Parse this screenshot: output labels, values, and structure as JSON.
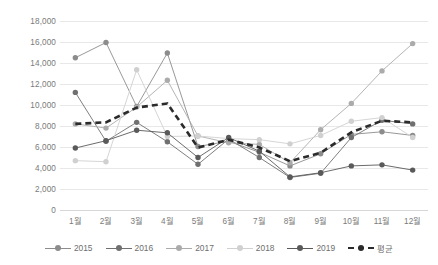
{
  "chart_data": {
    "type": "line",
    "title": "",
    "subtitle": "",
    "xlabel": "",
    "ylabel": "",
    "ylim": [
      0,
      18000
    ],
    "ytick_step": 2000,
    "ytick_labels": [
      "18,000",
      "16,000",
      "14,000",
      "12,000",
      "10,000",
      "8,000",
      "6,000",
      "4,000",
      "2,000",
      "0"
    ],
    "ytick_values": [
      18000,
      16000,
      14000,
      12000,
      10000,
      8000,
      6000,
      4000,
      2000,
      0
    ],
    "categories": [
      "1월",
      "2월",
      "3월",
      "4월",
      "5월",
      "6월",
      "7월",
      "8월",
      "9월",
      "10월",
      "11월",
      "12월"
    ],
    "grid": "horizontal",
    "legend_position": "bottom",
    "series": [
      {
        "name": "2015",
        "color": "#8c8c8c",
        "values": [
          14500,
          15950,
          9850,
          14950,
          6050,
          6550,
          5500,
          4200,
          5350,
          7200,
          7450,
          7100
        ]
      },
      {
        "name": "2016",
        "color": "#707070",
        "values": [
          11200,
          6550,
          8350,
          6500,
          4350,
          6750,
          5000,
          3100,
          3500,
          6900,
          8550,
          8200
        ]
      },
      {
        "name": "2017",
        "color": "#ababab",
        "values": [
          8200,
          7800,
          9800,
          12350,
          7050,
          6400,
          6250,
          4500,
          7650,
          10150,
          13250,
          15850
        ]
      },
      {
        "name": "2018",
        "color": "#d0d0d0",
        "values": [
          4700,
          4600,
          13350,
          7000,
          7050,
          6800,
          6700,
          6300,
          7100,
          8450,
          8800,
          6900
        ]
      },
      {
        "name": "2019",
        "color": "#5a5a5a",
        "values": [
          5900,
          6600,
          7600,
          7350,
          5000,
          6900,
          5600,
          3150,
          3550,
          4200,
          4300,
          3800
        ]
      },
      {
        "name": "평균",
        "color": "#2b2b2b",
        "style": "dashed",
        "values": [
          8200,
          8350,
          9750,
          10150,
          5950,
          6700,
          5950,
          4650,
          5450,
          7400,
          8500,
          8350
        ]
      }
    ]
  },
  "legend": {
    "items": [
      {
        "label": "2015"
      },
      {
        "label": "2016"
      },
      {
        "label": "2017"
      },
      {
        "label": "2018"
      },
      {
        "label": "2019"
      },
      {
        "label": "평균"
      }
    ]
  }
}
